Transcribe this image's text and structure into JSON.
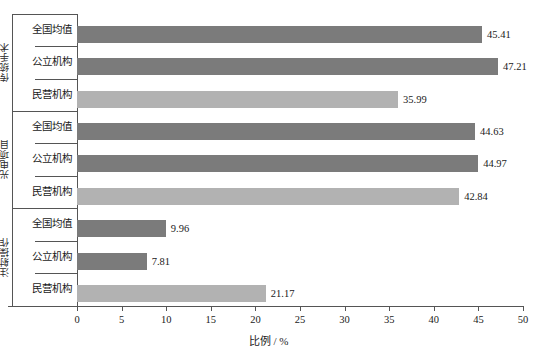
{
  "chart_data": {
    "type": "bar",
    "orientation": "horizontal",
    "title": "",
    "xlabel": "比例 / %",
    "ylabel": "",
    "xlim": [
      0,
      50
    ],
    "xticks": [
      0,
      5,
      10,
      15,
      20,
      25,
      30,
      35,
      40,
      45,
      50
    ],
    "xtick_labels": [
      "0",
      "5",
      "10",
      "15",
      "20",
      "25",
      "30",
      "35",
      "40",
      "45",
      "50"
    ],
    "grid": false,
    "legend": "none",
    "value_label_format": "2dp",
    "colors": {
      "national_average": "#7b7b7b",
      "public_institution": "#7b7b7b",
      "private_institution": "#b2b2b2",
      "axis": "#555555",
      "text": "#1a1a1a",
      "background": "#ffffff"
    },
    "categories": [
      "全国均值",
      "公立机构",
      "民营机构"
    ],
    "groups": [
      {
        "name": "传统手术",
        "bars": [
          {
            "category": "全国均值",
            "value": 45.41,
            "label": "45.41",
            "shade": "dark"
          },
          {
            "category": "公立机构",
            "value": 47.21,
            "label": "47.21",
            "shade": "dark"
          },
          {
            "category": "民营机构",
            "value": 35.99,
            "label": "35.99",
            "shade": "light"
          }
        ]
      },
      {
        "name": "光电项目",
        "bars": [
          {
            "category": "全国均值",
            "value": 44.63,
            "label": "44.63",
            "shade": "dark"
          },
          {
            "category": "公立机构",
            "value": 44.97,
            "label": "44.97",
            "shade": "dark"
          },
          {
            "category": "民营机构",
            "value": 42.84,
            "label": "42.84",
            "shade": "light"
          }
        ]
      },
      {
        "name": "注射操作",
        "bars": [
          {
            "category": "全国均值",
            "value": 9.96,
            "label": "9.96",
            "shade": "dark"
          },
          {
            "category": "公立机构",
            "value": 7.81,
            "label": "7.81",
            "shade": "dark"
          },
          {
            "category": "民营机构",
            "value": 21.17,
            "label": "21.17",
            "shade": "light"
          }
        ]
      }
    ]
  }
}
